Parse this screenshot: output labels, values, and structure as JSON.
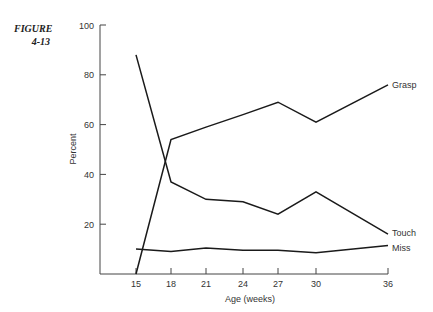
{
  "figure": {
    "label_line1": "FIGURE",
    "label_line2": "4-13"
  },
  "chart_data": {
    "type": "line",
    "title": "",
    "xlabel": "Age (weeks)",
    "ylabel": "Percent",
    "x": [
      15,
      18,
      21,
      24,
      27,
      30,
      36
    ],
    "x_tick_labels": [
      "15",
      "18",
      "21",
      "24",
      "27",
      "30",
      "36"
    ],
    "y_tick_labels": [
      "20",
      "40",
      "60",
      "80",
      "100"
    ],
    "ylim": [
      0,
      100
    ],
    "grid": false,
    "legend": "inline labels at line ends",
    "series": [
      {
        "name": "Grasp",
        "values": [
          0,
          54,
          59,
          64,
          69,
          61,
          76
        ]
      },
      {
        "name": "Touch",
        "values": [
          88,
          37,
          30,
          29,
          24,
          33,
          16
        ]
      },
      {
        "name": "Miss",
        "values": [
          10,
          9,
          10.5,
          9.5,
          9.5,
          8.5,
          11.5
        ]
      }
    ]
  }
}
